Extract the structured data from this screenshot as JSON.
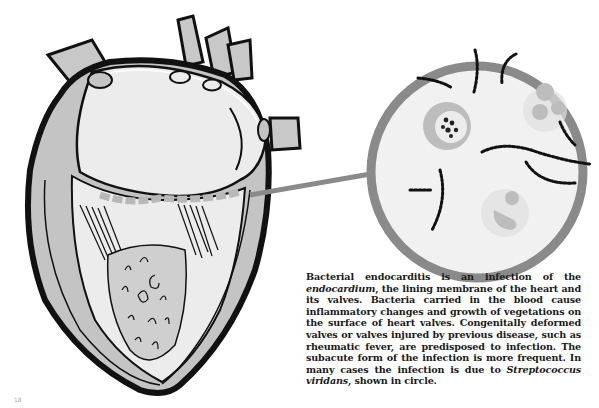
{
  "figure": {
    "elements": [
      "heart-cross-section",
      "magnified-circle",
      "pointer-arrow"
    ],
    "colors": {
      "outline": "#111111",
      "fill_light": "#ececec",
      "fill_mid": "#c4c4c4",
      "circle_ring": "#8a8a8a",
      "vegetation": "#b8b8b8"
    }
  },
  "caption": {
    "part1": "Bacterial endocarditis is an infection of the ",
    "term1": "endocardium",
    "part2": ", the lining membrane of the heart and its valves. Bacteria carried in the blood cause inflammatory changes and growth of vegetations on the surface of heart valves. Congenitally deformed valves or valves injured by previous disease, such as rheumatic fever, are predisposed to infection. The subacute form of the infection is more frequent. In many cases the infection is due to ",
    "term2": "Streptococcus viridans",
    "part3": ", shown in circle."
  },
  "page_mark": "18"
}
